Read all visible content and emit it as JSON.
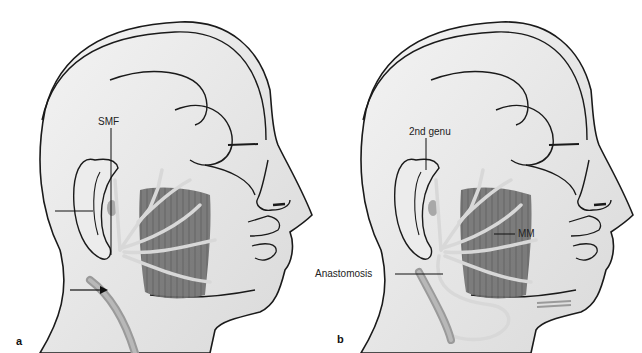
{
  "figure": {
    "panels": [
      {
        "id": "a",
        "letter": "a",
        "labels": {
          "smf": "SMF"
        },
        "arrows": [
          "ear-region-arrow",
          "neck-vessel-arrow"
        ]
      },
      {
        "id": "b",
        "letter": "b",
        "labels": {
          "second_genu": "2nd genu",
          "mm": "MM",
          "anastomosis": "Anastomosis"
        }
      }
    ],
    "colors": {
      "skin": "#e6e6e6",
      "skin_light": "#f2f2f2",
      "outline": "#1a1a1a",
      "muscle": "#6e6e6e",
      "nerve": "#d6d6d6",
      "vessel": "#9a9a9a"
    }
  }
}
